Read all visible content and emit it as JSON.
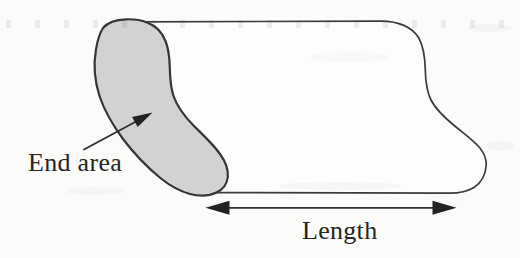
{
  "diagram": {
    "labels": {
      "end_area": "End area",
      "length": "Length"
    },
    "colors": {
      "paper": "#fbfbf9",
      "outline": "#3b3b3b",
      "end_area_fill": "#d2d2d1",
      "arrow": "#222220",
      "text": "#262422"
    }
  }
}
